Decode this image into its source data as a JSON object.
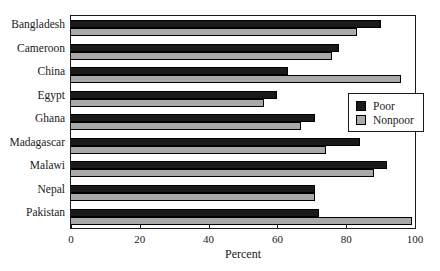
{
  "chart_data": {
    "type": "bar",
    "orientation": "horizontal",
    "title": "",
    "xlabel": "Percent",
    "ylabel": "",
    "xlim": [
      0,
      100
    ],
    "xticks": [
      "0",
      "20",
      "40",
      "60",
      "80",
      "100"
    ],
    "grid": false,
    "legend_position": "middle-right",
    "categories": [
      "Bangladesh",
      "Cameroon",
      "China",
      "Egypt",
      "Ghana",
      "Madagascar",
      "Malawi",
      "Nepal",
      "Pakistan"
    ],
    "series": [
      {
        "name": "Poor",
        "color": "#1a1a1a",
        "values": [
          90,
          78,
          63,
          60,
          71,
          84,
          92,
          71,
          72
        ]
      },
      {
        "name": "Nonpoor",
        "color": "#a9a9a9",
        "values": [
          83,
          76,
          96,
          56,
          67,
          74,
          88,
          71,
          99
        ]
      }
    ]
  }
}
